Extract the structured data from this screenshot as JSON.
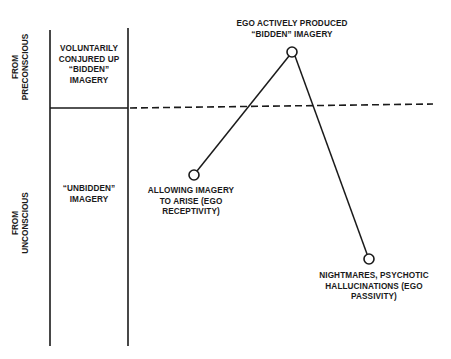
{
  "diagram": {
    "axis_labels": {
      "top": [
        "FROM",
        "PRECONSCIOUS"
      ],
      "bottom": [
        "FROM",
        "UNCONSCIOUS"
      ]
    },
    "column_labels": {
      "upper": [
        "VOLUNTARILY",
        "CONJURED UP",
        "“BIDDEN”",
        "IMAGERY"
      ],
      "lower": [
        "“UNBIDDEN”",
        "IMAGERY"
      ]
    },
    "points": [
      {
        "id": "receptivity",
        "x": 194,
        "y": 175,
        "label": [
          "ALLOWING IMAGERY",
          "TO ARISE (EGO",
          "RECEPTIVITY)"
        ]
      },
      {
        "id": "active",
        "x": 292,
        "y": 52,
        "label": [
          "EGO ACTIVELY PRODUCED",
          "“BIDDEN” IMAGERY"
        ]
      },
      {
        "id": "passivity",
        "x": 369,
        "y": 259,
        "label": [
          "NIGHTMARES, PSYCHOTIC",
          "HALLUCINATIONS (EGO",
          "PASSIVITY)"
        ]
      }
    ],
    "colors": {
      "ink": "#1a1a1a",
      "background": "#ffffff"
    }
  }
}
